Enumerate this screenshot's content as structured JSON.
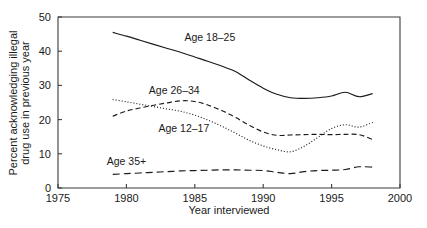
{
  "chart_data": {
    "type": "line",
    "title": "",
    "xlabel": "Year interviewed",
    "ylabel": "Percent acknowledging illegal drug use in previous year",
    "ylabel_line1": "Percent acknowledging illegal",
    "ylabel_line2": "drug use in previous year",
    "xlim": [
      1975,
      2000
    ],
    "ylim": [
      0,
      50
    ],
    "xticks": [
      1975,
      1980,
      1985,
      1990,
      1995,
      2000
    ],
    "xtick_labels": [
      "1975",
      "1980",
      "1985",
      "1990",
      "1995",
      "2000"
    ],
    "yticks": [
      0,
      10,
      20,
      30,
      40,
      50
    ],
    "ytick_labels": [
      "0",
      "10",
      "20",
      "30",
      "40",
      "50"
    ],
    "grid": false,
    "legend_position": "inline-annotations",
    "series": [
      {
        "name": "Age 18-25",
        "label": "Age 18–25",
        "style": "solid",
        "label_x": 1986.1,
        "label_y": 43.0,
        "x": [
          1979,
          1980,
          1981,
          1982,
          1983,
          1984,
          1985,
          1986,
          1987,
          1988,
          1989,
          1990,
          1991,
          1992,
          1993,
          1994,
          1995,
          1996,
          1997,
          1998
        ],
        "values": [
          45.5,
          44.4,
          43.2,
          42.0,
          40.8,
          39.6,
          38.3,
          37.0,
          35.6,
          34.0,
          31.5,
          29.2,
          27.4,
          26.4,
          26.2,
          26.4,
          26.9,
          28.0,
          26.7,
          27.6
        ]
      },
      {
        "name": "Age 26-34",
        "label": "Age 26–34",
        "style": "dashed",
        "label_x": 1983.5,
        "label_y": 27.5,
        "x": [
          1979,
          1980,
          1981,
          1982,
          1983,
          1984,
          1985,
          1986,
          1987,
          1988,
          1989,
          1990,
          1991,
          1992,
          1993,
          1994,
          1995,
          1996,
          1997,
          1998
        ],
        "values": [
          21.0,
          22.5,
          23.4,
          24.2,
          24.9,
          25.5,
          25.3,
          24.2,
          22.6,
          20.6,
          18.3,
          16.4,
          15.4,
          15.5,
          15.6,
          15.7,
          15.6,
          15.7,
          15.6,
          14.2
        ]
      },
      {
        "name": "Age 12-17",
        "label": "Age 12–17",
        "style": "dotted",
        "label_x": 1984.2,
        "label_y": 16.5,
        "x": [
          1979,
          1980,
          1981,
          1982,
          1983,
          1984,
          1985,
          1986,
          1987,
          1988,
          1989,
          1990,
          1991,
          1992,
          1993,
          1994,
          1995,
          1996,
          1997,
          1998
        ],
        "values": [
          25.9,
          25.2,
          24.5,
          23.8,
          23.1,
          22.4,
          21.3,
          19.8,
          18.0,
          16.0,
          13.9,
          12.3,
          11.2,
          10.6,
          12.2,
          14.8,
          17.4,
          18.5,
          17.8,
          19.2
        ]
      },
      {
        "name": "Age 35+",
        "label": "Age 35+",
        "style": "longdash",
        "label_x": 1980.0,
        "label_y": 6.6,
        "x": [
          1979,
          1980,
          1981,
          1982,
          1983,
          1984,
          1985,
          1986,
          1987,
          1988,
          1989,
          1990,
          1991,
          1992,
          1993,
          1994,
          1995,
          1996,
          1997,
          1998
        ],
        "values": [
          4.0,
          4.2,
          4.4,
          4.6,
          4.8,
          5.0,
          5.1,
          5.2,
          5.3,
          5.3,
          5.2,
          5.1,
          4.6,
          4.2,
          4.8,
          5.1,
          5.2,
          5.4,
          6.2,
          6.1
        ]
      }
    ]
  }
}
